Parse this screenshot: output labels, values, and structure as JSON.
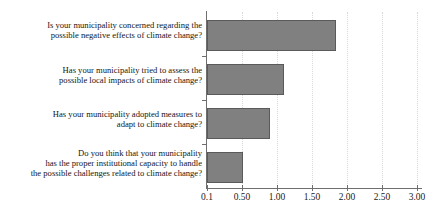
{
  "chart_data": {
    "type": "bar",
    "orientation": "horizontal",
    "title": "",
    "subtitle": "",
    "xlabel": "",
    "ylabel": "",
    "categories": [
      "Is your municipality concerned regarding the\npossible negative effects of climate change?",
      "Has your municipality tried to assess the\npossible local impacts of climate change?",
      "Has your municipality adopted measures to\nadapt to climate change?",
      "Do you think that your municipality\nhas the proper institutional capacity to handle\nthe possible challenges related to climate change?"
    ],
    "values": [
      1.94,
      1.2,
      1.0,
      0.62
    ],
    "xlim": [
      0.1,
      3.0
    ],
    "xticks": [
      0.1,
      0.5,
      1.0,
      1.5,
      2.0,
      2.5,
      3.0
    ],
    "xticklabels": [
      "0.1",
      "0.50",
      "1.00",
      "1.50",
      "2.00",
      "2.50",
      "3.00"
    ],
    "grid": "vertical-dotted",
    "legend": "none",
    "colors": {
      "bar_fill": "#808080",
      "bar_border": "#5a5a5a",
      "axis": "#6e6e6e",
      "grid": "#d9d9d9",
      "text": "#161616",
      "background": "#ffffff"
    }
  }
}
